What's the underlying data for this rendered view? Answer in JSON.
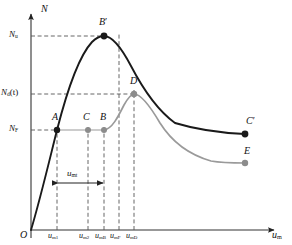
{
  "figure": {
    "axes": {
      "y_label": "N",
      "x_label": "u",
      "x_label_sub": "m",
      "origin_label": "O"
    },
    "y_ticks": [
      {
        "id": "Nu",
        "base": "N",
        "sub": "u",
        "suffix": "",
        "value": 0.88,
        "y_px": 36
      },
      {
        "id": "Ndt",
        "base": "N",
        "sub": "d",
        "suffix": "(t)",
        "value": 0.55,
        "y_px": 94
      },
      {
        "id": "NF",
        "base": "N",
        "sub": "F",
        "suffix": "",
        "value": 0.3,
        "y_px": 130
      }
    ],
    "x_ticks": [
      {
        "id": "um1",
        "base": "u",
        "sub": "m1",
        "x_px": 57
      },
      {
        "id": "um2",
        "base": "u",
        "sub": "m2",
        "x_px": 88
      },
      {
        "id": "umB",
        "base": "u",
        "sub": "mB",
        "x_px": 104
      },
      {
        "id": "umF",
        "base": "u",
        "sub": "mF",
        "x_px": 119
      },
      {
        "id": "umD",
        "base": "u",
        "sub": "mD",
        "x_px": 134
      }
    ],
    "points": [
      {
        "id": "A",
        "label": "A",
        "prime": false,
        "color": "#1a1a1a",
        "x_px": 57,
        "y_px": 130,
        "label_dx": -3,
        "label_dy": -16
      },
      {
        "id": "B2",
        "label": "B",
        "prime": true,
        "color": "#1a1a1a",
        "x_px": 104,
        "y_px": 36,
        "label_dx": -3,
        "label_dy": -17
      },
      {
        "id": "C2",
        "label": "C",
        "prime": true,
        "color": "#1a1a1a",
        "x_px": 245,
        "y_px": 134,
        "label_dx": 1,
        "label_dy": -16
      },
      {
        "id": "C",
        "label": "C",
        "prime": false,
        "color": "#8c8c8c",
        "x_px": 88,
        "y_px": 130,
        "label_dx": -3,
        "label_dy": -16
      },
      {
        "id": "B",
        "label": "B",
        "prime": false,
        "color": "#8c8c8c",
        "x_px": 104,
        "y_px": 130,
        "label_dx": -2,
        "label_dy": -16
      },
      {
        "id": "D",
        "label": "D",
        "prime": false,
        "color": "#8c8c8c",
        "x_px": 134,
        "y_px": 94,
        "label_dx": -2,
        "label_dy": -16
      },
      {
        "id": "E",
        "label": "E",
        "prime": false,
        "color": "#8c8c8c",
        "x_px": 245,
        "y_px": 163,
        "label_dx": 0,
        "label_dy": -15
      }
    ],
    "segment": {
      "id": "umt",
      "base": "u",
      "sub": "mt",
      "from_x_px": 57,
      "to_x_px": 104,
      "y_px": 183,
      "label_dx": 12,
      "label_dy": -13
    },
    "curves": [
      {
        "id": "primary-curve",
        "name": "undegraded-capacity-curve",
        "color": "#1a1a1a",
        "width": 1.9,
        "path": "M 31,230 C 40,200 48,166 57,130 C 67,91 79,56 92,42 C 97,37 100,36 104,36 C 112,36 121,47 131,66 C 143,89 157,110 175,123 C 198,130 222,133 245,134"
      },
      {
        "id": "secondary-curve",
        "name": "degraded-capacity-curve",
        "color": "#9a9a9a",
        "width": 1.7,
        "path": "M 104,130 C 112,129 118,117 124,105 C 128,98 131,94 134,94 C 141,94 150,106 160,123 C 172,142 190,155 211,161 C 222,163 234,163 245,163"
      }
    ],
    "connectors": [
      {
        "id": "NF-to-A",
        "name": "nf-level-line",
        "kind": "solid-gray",
        "x1": 88,
        "y1": 130,
        "x2": 104,
        "y2": 130
      }
    ],
    "colors": {
      "primary": "#1a1a1a",
      "secondary": "#9a9a9a",
      "axis": "#333333",
      "dash": "#555555",
      "background": "#ffffff"
    }
  }
}
